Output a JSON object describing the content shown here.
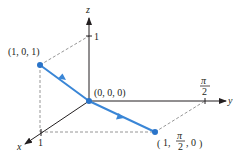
{
  "diagram": {
    "type": "3d-path",
    "colors": {
      "axis": "#231f20",
      "dashed": "#8a8a8a",
      "path": "#3a86d6",
      "point": "#2a74c9"
    },
    "axes": {
      "x": {
        "label": "x",
        "tick": "1"
      },
      "y": {
        "label": "y",
        "tick_num": "π",
        "tick_den": "2"
      },
      "z": {
        "label": "z",
        "tick": "1"
      }
    },
    "points": [
      {
        "label": "(1, 0, 1)"
      },
      {
        "label": "(0, 0, 0)"
      },
      {
        "label_prefix": "1, ",
        "label_num": "π",
        "label_den": "2",
        "label_suffix": ", 0"
      }
    ],
    "path_segments": [
      {
        "from": "(1, 0, 1)",
        "to": "(0, 0, 0)",
        "direction_arrow": true
      },
      {
        "from": "(0, 0, 0)",
        "to": "(1, π/2, 0)",
        "direction_arrow": true
      }
    ]
  }
}
